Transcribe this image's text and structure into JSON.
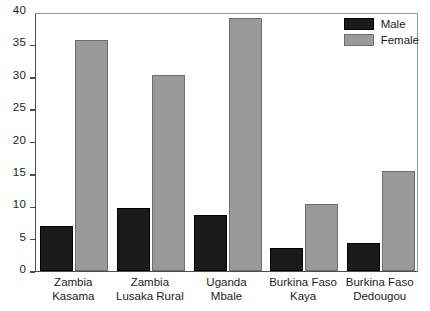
{
  "chart_data": {
    "type": "bar",
    "title": "",
    "subtitle": "",
    "xlabel": "",
    "ylabel": "",
    "ylim": [
      0,
      40
    ],
    "yticks": [
      0,
      5,
      10,
      15,
      20,
      25,
      30,
      35,
      40
    ],
    "ytick_labels": [
      "0",
      "5",
      "10",
      "15",
      "20",
      "25",
      "30",
      "35",
      "40"
    ],
    "grid": false,
    "legend_position": "top-right",
    "categories": [
      "Zambia Kasama",
      "Zambia Lusaka Rural",
      "Uganda Mbale",
      "Burkina Faso Kaya",
      "Burkina Faso Dedougou"
    ],
    "category_lines": [
      [
        "Zambia",
        "Kasama"
      ],
      [
        "Zambia",
        "Lusaka Rural"
      ],
      [
        "Uganda",
        "Mbale"
      ],
      [
        "Burkina Faso",
        "Kaya"
      ],
      [
        "Burkina Faso",
        "Dedougou"
      ]
    ],
    "series": [
      {
        "name": "Male",
        "color": "#1a1a1a",
        "values": [
          7.0,
          9.8,
          8.6,
          3.5,
          4.3
        ]
      },
      {
        "name": "Female",
        "color": "#9a9a9a",
        "values": [
          35.7,
          30.3,
          39.0,
          10.3,
          15.5
        ]
      }
    ],
    "axis_color": "#4d4d4d"
  },
  "legend": {
    "items": [
      {
        "label": "Male",
        "swatch": "male"
      },
      {
        "label": "Female",
        "swatch": "female"
      }
    ]
  }
}
